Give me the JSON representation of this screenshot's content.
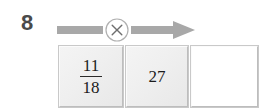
{
  "widget": {
    "name": "fraction-multiplication-problem",
    "question_number": "8",
    "background_color": "#ffffff"
  },
  "operation": {
    "symbol": "×",
    "icon_name": "multiply-circle-icon",
    "arrow_icon_name": "right-arrow-icon",
    "arrow_color": "#a8a8a8",
    "circle_fill": "#ffffff",
    "circle_stroke": "#a8a8a8"
  },
  "cells": [
    {
      "id": "cell-fraction",
      "type": "fraction",
      "numerator": "11",
      "denominator": "18",
      "editable": false,
      "background": "#efefef"
    },
    {
      "id": "cell-number",
      "type": "number",
      "value": "27",
      "editable": false,
      "background": "#efefef"
    },
    {
      "id": "cell-answer",
      "type": "answer",
      "value": "",
      "placeholder": "",
      "editable": true,
      "background": "#ffffff"
    }
  ]
}
